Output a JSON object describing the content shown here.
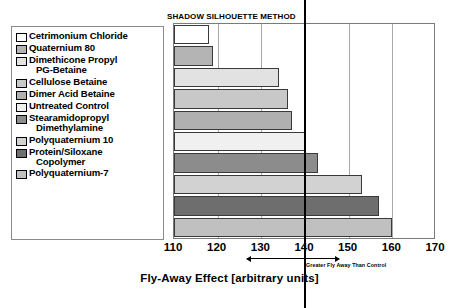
{
  "chart_data": {
    "type": "bar",
    "orientation": "horizontal",
    "title": "SHADOW SILHOUETTE METHOD",
    "xlabel": "Fly-Away Effect [arbitrary units]",
    "ylabel": "",
    "xlim": [
      110,
      170
    ],
    "xticks": [
      110,
      120,
      130,
      140,
      150,
      160,
      170
    ],
    "grid": true,
    "legend_position": "left-outside",
    "reference_line": {
      "value": 140,
      "label": "control"
    },
    "categories": [
      "Cetrimonium Chloride",
      "Quaternium 80",
      "Dimethicone Propyl PG-Betaine",
      "Cellulose Betaine",
      "Dimer Acid Betaine",
      "Untreated Control",
      "Stearamidopropyl Dimethylamine",
      "Polyquaternium 10",
      "Protein/Siloxane Copolymer",
      "Polyquaternium-7"
    ],
    "values": [
      118,
      119,
      134,
      136,
      137,
      140,
      143,
      153,
      157,
      160
    ],
    "colors": [
      "#ffffff",
      "#b4b4b4",
      "#e2e2e2",
      "#c8c8c8",
      "#b0b0b0",
      "#f0f0f0",
      "#8c8c8c",
      "#d2d2d2",
      "#6e6e6e",
      "#c0c0c0"
    ],
    "annotations": [
      {
        "text": "Less Fly Away Than Control",
        "side": "left"
      },
      {
        "text": "Greater Fly Away Than Control",
        "side": "right"
      }
    ]
  },
  "legend": {
    "items": [
      {
        "label_line1": "Cetrimonium Chloride",
        "label_line2": ""
      },
      {
        "label_line1": "Quaternium 80",
        "label_line2": ""
      },
      {
        "label_line1": "Dimethicone Propyl",
        "label_line2": "PG-Betaine"
      },
      {
        "label_line1": "Cellulose Betaine",
        "label_line2": ""
      },
      {
        "label_line1": "Dimer Acid Betaine",
        "label_line2": ""
      },
      {
        "label_line1": "Untreated Control",
        "label_line2": ""
      },
      {
        "label_line1": "Stearamidopropyl",
        "label_line2": "Dimethylamine"
      },
      {
        "label_line1": "Polyquaternium 10",
        "label_line2": ""
      },
      {
        "label_line1": "Protein/Siloxane",
        "label_line2": "Copolymer"
      },
      {
        "label_line1": "Polyquaternium-7",
        "label_line2": ""
      }
    ]
  }
}
